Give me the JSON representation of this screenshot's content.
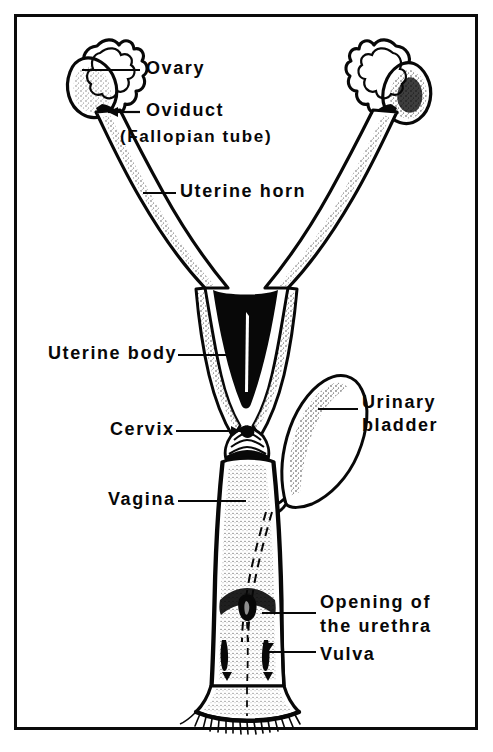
{
  "figure": {
    "background_color": "#ffffff",
    "ink_color": "#080808",
    "border_color": "#0b0b0b"
  },
  "labels": {
    "ovary": "Ovary",
    "oviduct": "Oviduct",
    "fallopian": "(Fallopian tube)",
    "uterine_horn": "Uterine horn",
    "uterine_body": "Uterine body",
    "cervix": "Cervix",
    "vagina": "Vagina",
    "urinary_1": "Urinary",
    "urinary_2": "bladder",
    "urethra_1": "Opening of",
    "urethra_2": "the urethra",
    "vulva": "Vulva"
  },
  "structures": [
    {
      "name": "ovary-left",
      "label": "Ovary",
      "side": "left"
    },
    {
      "name": "ovary-right",
      "label": "Ovary",
      "side": "right"
    },
    {
      "name": "oviduct-left",
      "label": "Oviduct",
      "side": "left"
    },
    {
      "name": "oviduct-right",
      "label": "Oviduct",
      "side": "right"
    },
    {
      "name": "uterine-horn-left",
      "label": "Uterine horn",
      "side": "left"
    },
    {
      "name": "uterine-horn-right",
      "label": "Uterine horn",
      "side": "right"
    },
    {
      "name": "uterine-body",
      "label": "Uterine body",
      "side": "center"
    },
    {
      "name": "cervix",
      "label": "Cervix",
      "side": "center"
    },
    {
      "name": "vagina",
      "label": "Vagina",
      "side": "center"
    },
    {
      "name": "urinary-bladder",
      "label": "Urinary bladder",
      "side": "right"
    },
    {
      "name": "urethral-opening",
      "label": "Opening of the urethra",
      "side": "center"
    },
    {
      "name": "vulva",
      "label": "Vulva",
      "side": "center"
    }
  ]
}
